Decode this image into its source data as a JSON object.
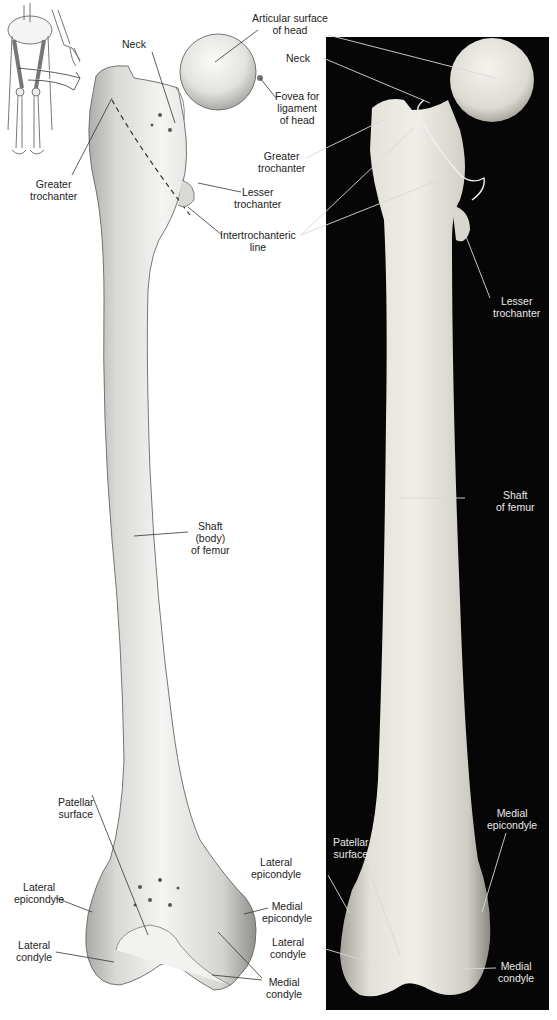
{
  "figure": {
    "panels": [
      "illustration",
      "photograph"
    ],
    "inset_icon": "lower-limb-skeleton-icon"
  },
  "illustration_labels": {
    "neck": "Neck",
    "articular_surface": [
      "Articular surface",
      "of head"
    ],
    "fovea": [
      "Fovea for",
      "ligament",
      "of head"
    ],
    "greater_trochanter": [
      "Greater",
      "trochanter"
    ],
    "lesser_trochanter": [
      "Lesser",
      "trochanter"
    ],
    "intertrochanteric_line": [
      "Intertrochanteric",
      "line"
    ],
    "shaft": [
      "Shaft",
      "(body)",
      "of femur"
    ],
    "patellar_surface": [
      "Patellar",
      "surface"
    ],
    "lateral_epicondyle": [
      "Lateral",
      "epicondyle"
    ],
    "medial_epicondyle": [
      "Medial",
      "epicondyle"
    ],
    "lateral_condyle": [
      "Lateral",
      "condyle"
    ],
    "medial_condyle": [
      "Medial",
      "condyle"
    ]
  },
  "photo_labels": {
    "neck": "Neck",
    "greater_trochanter": [
      "Greater",
      "trochanter"
    ],
    "lesser_trochanter": [
      "Lesser",
      "trochanter"
    ],
    "shaft": [
      "Shaft",
      "of femur"
    ],
    "medial_epicondyle": [
      "Medial",
      "epicondyle"
    ],
    "lateral_epicondyle": [
      "Lateral",
      "epicondyle"
    ],
    "patellar_surface": [
      "Patellar",
      "surface"
    ],
    "lateral_condyle": [
      "Lateral",
      "condyle"
    ],
    "medial_condyle": [
      "Medial",
      "condyle"
    ]
  },
  "colors": {
    "background": "#ffffff",
    "photo_panel": "#060606",
    "bone_light": "#f2f2f0",
    "bone_shade": "#b8b8b4",
    "label_text_dark": "#222222",
    "label_text_light": "#e8e8e8"
  }
}
